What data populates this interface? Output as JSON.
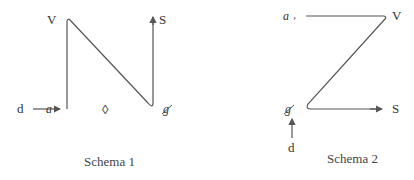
{
  "schema1": {
    "caption": "Schema 1",
    "labels": {
      "top_left": "V",
      "top_right": "S",
      "bottom_input": "d",
      "bottom_left": "a",
      "middle_symbol": "◊",
      "bottom_right": "g"
    }
  },
  "schema2": {
    "caption": "Schema 2",
    "labels": {
      "top_left": "a",
      "top_right": "V",
      "bottom_left": "g",
      "bottom_right": "S",
      "bottom_input": "d"
    }
  }
}
